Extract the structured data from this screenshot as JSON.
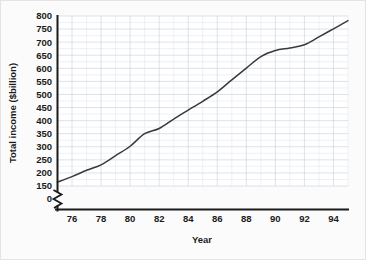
{
  "chart_data": {
    "type": "line",
    "title": "",
    "xlabel": "Year",
    "ylabel": "Total income ($billion)",
    "xlim": [
      75,
      95
    ],
    "ylim": [
      150,
      800
    ],
    "y_axis_break": true,
    "y_break_labels": [
      "0",
      "150"
    ],
    "grid": true,
    "legend": "none",
    "x_tick_labels": [
      "76",
      "78",
      "80",
      "82",
      "84",
      "86",
      "88",
      "90",
      "92",
      "94"
    ],
    "x_tick_values": [
      76,
      78,
      80,
      82,
      84,
      86,
      88,
      90,
      92,
      94
    ],
    "y_tick_labels": [
      "150",
      "200",
      "250",
      "300",
      "350",
      "400",
      "450",
      "500",
      "550",
      "600",
      "650",
      "700",
      "750",
      "800"
    ],
    "y_tick_values": [
      150,
      200,
      250,
      300,
      350,
      400,
      450,
      500,
      550,
      600,
      650,
      700,
      750,
      800
    ],
    "zero_label": "0",
    "series": [
      {
        "name": "Total income",
        "color": "#3a3a3a",
        "x": [
          75,
          76,
          77,
          78,
          79,
          80,
          81,
          82,
          83,
          84,
          85,
          86,
          87,
          88,
          89,
          90,
          91,
          92,
          93,
          94,
          95
        ],
        "values": [
          165,
          186,
          210,
          231,
          266,
          302,
          350,
          370,
          406,
          440,
          474,
          510,
          556,
          601,
          645,
          668,
          678,
          690,
          720,
          751,
          782
        ]
      }
    ]
  },
  "axis": {
    "x_title": "Year",
    "y_title": "Total income ($billion)"
  }
}
